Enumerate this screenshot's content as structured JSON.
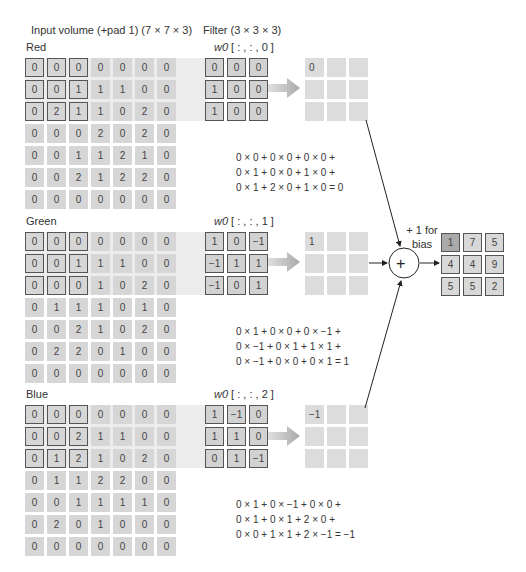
{
  "header": {
    "input_title": "Input volume (+pad 1) (7 × 7 × 3)",
    "filter_title": "Filter (3 × 3 × 3)"
  },
  "channels": [
    {
      "name": "Red",
      "input": [
        [
          "0",
          "0",
          "0",
          "0",
          "0",
          "0",
          "0"
        ],
        [
          "0",
          "0",
          "1",
          "1",
          "1",
          "0",
          "0"
        ],
        [
          "0",
          "2",
          "1",
          "1",
          "0",
          "2",
          "0"
        ],
        [
          "0",
          "0",
          "0",
          "2",
          "0",
          "2",
          "0"
        ],
        [
          "0",
          "0",
          "1",
          "1",
          "2",
          "1",
          "0"
        ],
        [
          "0",
          "0",
          "2",
          "1",
          "2",
          "2",
          "0"
        ],
        [
          "0",
          "0",
          "0",
          "0",
          "0",
          "0",
          "0"
        ]
      ],
      "filter_label_prefix": "w0",
      "filter_label_suffix": " [ : , : , 0 ]",
      "filter": [
        [
          "0",
          "0",
          "0"
        ],
        [
          "1",
          "0",
          "0"
        ],
        [
          "1",
          "0",
          "0"
        ]
      ],
      "output_first": "0",
      "equation": [
        "0 × 0 + 0 × 0 + 0 × 0 +",
        "0 × 1 + 0 × 0 + 1 × 0 +",
        "0 × 1 + 2 × 0 + 1 × 0 = 0"
      ]
    },
    {
      "name": "Green",
      "input": [
        [
          "0",
          "0",
          "0",
          "0",
          "0",
          "0",
          "0"
        ],
        [
          "0",
          "0",
          "1",
          "1",
          "1",
          "0",
          "0"
        ],
        [
          "0",
          "0",
          "0",
          "1",
          "0",
          "2",
          "0"
        ],
        [
          "0",
          "1",
          "1",
          "1",
          "0",
          "1",
          "0"
        ],
        [
          "0",
          "0",
          "2",
          "1",
          "0",
          "2",
          "0"
        ],
        [
          "0",
          "2",
          "2",
          "0",
          "1",
          "0",
          "0"
        ],
        [
          "0",
          "0",
          "0",
          "0",
          "0",
          "0",
          "0"
        ]
      ],
      "filter_label_prefix": "w0",
      "filter_label_suffix": " [ : , : , 1 ]",
      "filter": [
        [
          "1",
          "0",
          "−1"
        ],
        [
          "−1",
          "1",
          "1"
        ],
        [
          "−1",
          "0",
          "1"
        ]
      ],
      "output_first": "1",
      "equation": [
        "0 × 1 + 0 × 0 + 0 × −1 +",
        "0 × −1 + 0 × 1 + 1 × 1 +",
        "0 × −1 + 0 × 0 + 0 × 1 = 1"
      ]
    },
    {
      "name": "Blue",
      "input": [
        [
          "0",
          "0",
          "0",
          "0",
          "0",
          "0",
          "0"
        ],
        [
          "0",
          "0",
          "2",
          "1",
          "1",
          "0",
          "0"
        ],
        [
          "0",
          "1",
          "2",
          "1",
          "0",
          "2",
          "0"
        ],
        [
          "0",
          "1",
          "1",
          "2",
          "2",
          "0",
          "0"
        ],
        [
          "0",
          "0",
          "1",
          "1",
          "1",
          "1",
          "0"
        ],
        [
          "0",
          "2",
          "0",
          "1",
          "0",
          "0",
          "0"
        ],
        [
          "0",
          "0",
          "0",
          "0",
          "0",
          "0",
          "0"
        ]
      ],
      "filter_label_prefix": "w0",
      "filter_label_suffix": " [ : , : , 2 ]",
      "filter": [
        [
          "1",
          "−1",
          "0"
        ],
        [
          "1",
          "1",
          "0"
        ],
        [
          "0",
          "1",
          "−1"
        ]
      ],
      "output_first": "−1",
      "equation": [
        "0 × 1 + 0 × −1 + 0 × 0 +",
        "0 × 1 + 0 × 1 + 2 × 0 +",
        "0 × 0 + 1 × 1 + 2 × −1 = −1"
      ]
    }
  ],
  "bias": {
    "line1": "+ 1 for",
    "line2": "bias",
    "operator": "+"
  },
  "final_output": [
    [
      "1",
      "7",
      "5"
    ],
    [
      "4",
      "4",
      "9"
    ],
    [
      "5",
      "5",
      "2"
    ]
  ],
  "colors": {
    "cell": "#d6d6d6",
    "band": "#ececec",
    "border": "#555555",
    "highlight_cell": "#aaaaaa",
    "arrow": "#b5b5b5"
  }
}
